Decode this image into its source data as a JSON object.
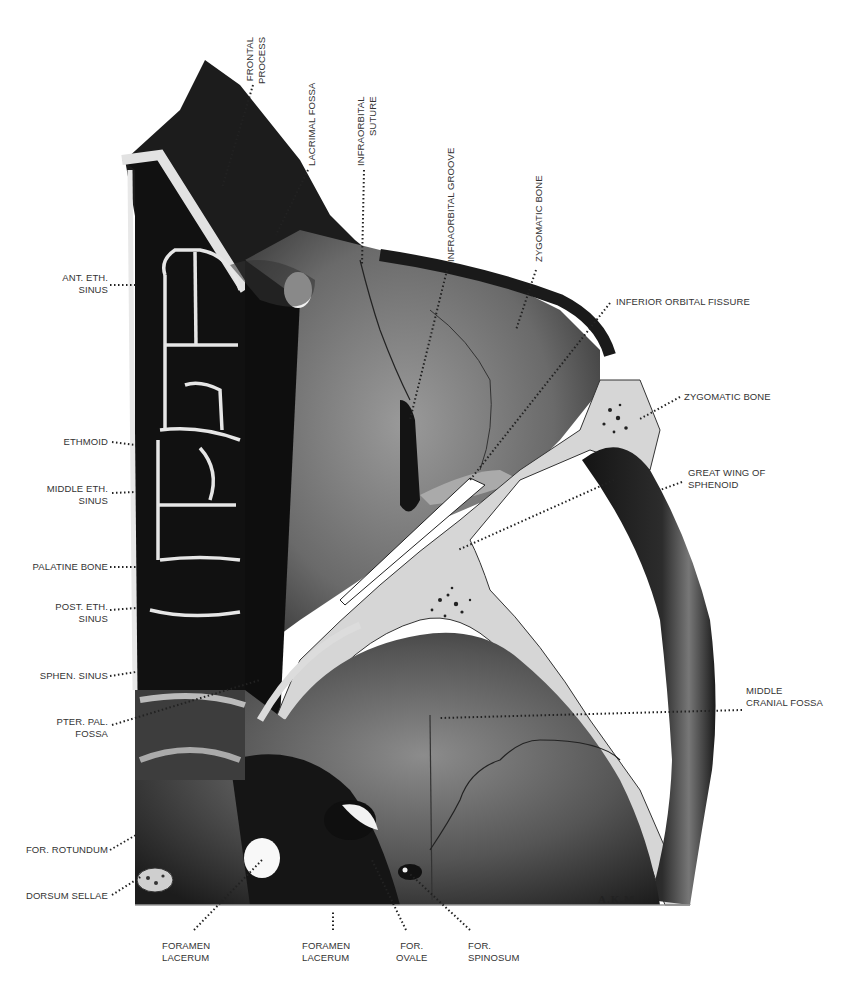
{
  "figure": {
    "signature": "A.K.M.",
    "colors": {
      "background": "#ffffff",
      "dark_tissue": "#1e1e1e",
      "mid_tissue": "#5a5a5a",
      "bone_light": "#d8d8d8",
      "label_text": "#333333",
      "leader_dots": "#222222"
    }
  },
  "labels": {
    "top": [
      {
        "id": "frontal-process",
        "lines": [
          "FRONTAL",
          "PROCESS"
        ]
      },
      {
        "id": "lacrimal-fossa",
        "lines": [
          "LACRIMAL FOSSA"
        ]
      },
      {
        "id": "infraorbital-suture",
        "lines": [
          "INFRAORBITAL",
          "SUTURE"
        ]
      },
      {
        "id": "infraorbital-groove",
        "lines": [
          "INFRAORBITAL GROOVE"
        ]
      },
      {
        "id": "zygomatic-bone-top",
        "lines": [
          "ZYGOMATIC BONE"
        ]
      }
    ],
    "left": [
      {
        "id": "ant-eth-sinus",
        "lines": [
          "ANT. ETH.",
          "SINUS"
        ]
      },
      {
        "id": "ethmoid",
        "lines": [
          "ETHMOID"
        ]
      },
      {
        "id": "middle-eth-sinus",
        "lines": [
          "MIDDLE ETH.",
          "SINUS"
        ]
      },
      {
        "id": "palatine-bone",
        "lines": [
          "PALATINE BONE"
        ]
      },
      {
        "id": "post-eth-sinus",
        "lines": [
          "POST. ETH.",
          "SINUS"
        ]
      },
      {
        "id": "sphen-sinus",
        "lines": [
          "SPHEN. SINUS"
        ]
      },
      {
        "id": "pter-pal-fossa",
        "lines": [
          "PTER. PAL.",
          "FOSSA"
        ]
      },
      {
        "id": "for-rotundum",
        "lines": [
          "FOR. ROTUNDUM"
        ]
      },
      {
        "id": "dorsum-sellae",
        "lines": [
          "DORSUM SELLAE"
        ]
      }
    ],
    "right": [
      {
        "id": "inferior-orbital-fissure",
        "lines": [
          "INFERIOR ORBITAL FISSURE"
        ]
      },
      {
        "id": "zygomatic-bone-right",
        "lines": [
          "ZYGOMATIC BONE"
        ]
      },
      {
        "id": "great-wing-sphenoid",
        "lines": [
          "GREAT WING OF",
          "SPHENOID"
        ]
      },
      {
        "id": "middle-cranial-fossa",
        "lines": [
          "MIDDLE",
          "CRANIAL FOSSA"
        ]
      }
    ],
    "bottom": [
      {
        "id": "foramen-lacerum-1",
        "lines": [
          "FORAMEN",
          "LACERUM"
        ]
      },
      {
        "id": "foramen-lacerum-2",
        "lines": [
          "FORAMEN",
          "LACERUM"
        ]
      },
      {
        "id": "for-ovale",
        "lines": [
          "FOR.",
          "OVALE"
        ]
      },
      {
        "id": "for-spinosum",
        "lines": [
          "FOR.",
          "SPINOSUM"
        ]
      }
    ]
  }
}
